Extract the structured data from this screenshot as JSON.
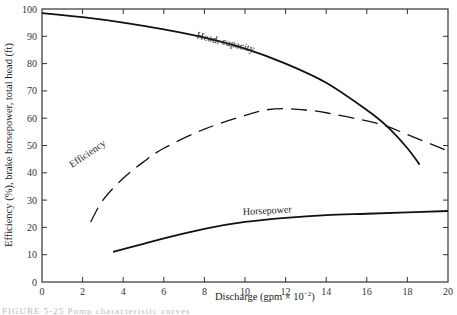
{
  "chart_data": {
    "type": "line",
    "title": "",
    "xlabel": "Discharge (gpm × 10⁻²)",
    "ylabel": "Efficiency (%), brake horsepower, total head (ft)",
    "xlim": [
      0,
      20
    ],
    "ylim": [
      0,
      100
    ],
    "x_ticks": [
      0,
      2,
      4,
      6,
      8,
      10,
      12,
      14,
      16,
      18,
      20
    ],
    "y_ticks": [
      0,
      10,
      20,
      30,
      40,
      50,
      60,
      70,
      80,
      90,
      100
    ],
    "grid": false,
    "legend": "none (inline curve labels)",
    "series": [
      {
        "name": "Head, capacity",
        "style": "solid",
        "x": [
          0,
          2,
          4,
          6,
          8,
          10,
          12,
          14,
          16,
          17,
          18,
          18.6
        ],
        "y": [
          98.5,
          97,
          95,
          92.5,
          89.5,
          85.5,
          80,
          73,
          63,
          57,
          49,
          43
        ]
      },
      {
        "name": "Efficiency",
        "style": "dashed",
        "x": [
          2.4,
          3,
          4,
          5,
          6,
          8,
          10,
          11,
          12,
          13,
          14,
          16,
          17,
          18,
          20
        ],
        "y": [
          22,
          30,
          38,
          44,
          49,
          56,
          61,
          63,
          63.5,
          63,
          62,
          59,
          57,
          54,
          48
        ]
      },
      {
        "name": "Horsepower",
        "style": "solid",
        "x": [
          3.5,
          5,
          6,
          8,
          10,
          12,
          14,
          16,
          18,
          20
        ],
        "y": [
          11,
          14,
          16,
          19.5,
          22,
          23.5,
          24.5,
          25,
          25.5,
          26
        ]
      }
    ],
    "annotations": [
      {
        "text": "Head, capacity",
        "x": 10,
        "y": 90
      },
      {
        "text": "Efficiency",
        "x": 5.2,
        "y": 43
      },
      {
        "text": "Horsepower",
        "x": 11,
        "y": 25
      }
    ]
  },
  "labels": {
    "xlabel": "Discharge (gpm × 10",
    "xlabel_exp": "−2",
    "xlabel_close": ")",
    "ylabel": "Efficiency (%), brake horsepower, total head (ft)",
    "head": "Head, capacity",
    "efficiency": "Efficiency",
    "horsepower": "Horsepower",
    "x_ticks": [
      "0",
      "2",
      "4",
      "6",
      "8",
      "10",
      "12",
      "14",
      "16",
      "18",
      "20"
    ],
    "y_ticks": [
      "0",
      "10",
      "20",
      "30",
      "40",
      "50",
      "60",
      "70",
      "80",
      "90",
      "100"
    ]
  },
  "caption": "FIGURE 5-25  Pump characteristic curves"
}
